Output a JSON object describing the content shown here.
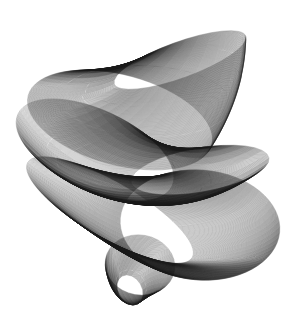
{
  "artwork": {
    "title": "Generative harmonograph line drawing",
    "background": "#ffffff",
    "stroke_color": "#1a1a1a",
    "stroke_width": 0.35,
    "stroke_opacity": 0.55,
    "ribbons": [
      {
        "name": "upper-hood",
        "count": 150,
        "center_path": [
          [
            180,
            60
          ],
          [
            160,
            95
          ],
          [
            120,
            120
          ]
        ],
        "rx": [
          70,
          95
        ],
        "ry": [
          18,
          45
        ],
        "rotation_deg": [
          -20,
          15
        ]
      },
      {
        "name": "middle-fold",
        "count": 170,
        "center_path": [
          [
            95,
            150
          ],
          [
            140,
            185
          ],
          [
            200,
            170
          ]
        ],
        "rx": [
          85,
          70
        ],
        "ry": [
          40,
          22
        ],
        "rotation_deg": [
          25,
          -10
        ]
      },
      {
        "name": "lower-sweep",
        "count": 160,
        "center_path": [
          [
            110,
            210
          ],
          [
            170,
            230
          ],
          [
            200,
            225
          ]
        ],
        "rx": [
          95,
          80
        ],
        "ry": [
          28,
          55
        ],
        "rotation_deg": [
          30,
          5
        ]
      },
      {
        "name": "bottom-lobe",
        "count": 80,
        "center_path": [
          [
            140,
            265
          ],
          [
            132,
            280
          ],
          [
            130,
            290
          ]
        ],
        "rx": [
          35,
          12
        ],
        "ry": [
          30,
          16
        ],
        "rotation_deg": [
          10,
          -30
        ]
      }
    ]
  }
}
